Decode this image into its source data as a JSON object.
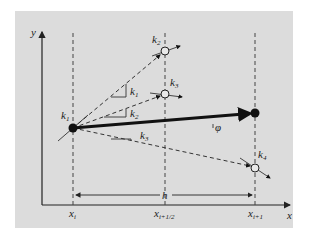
{
  "diagram": {
    "type": "runge-kutta-4-slope-estimates",
    "colors": {
      "panel": "#dcdcdc",
      "ink": "#1a1a1a",
      "dashed": "#444444"
    },
    "axes": {
      "x_label": "x",
      "y_label": "y"
    },
    "x_ticks": [
      {
        "id": "xi",
        "base": "x",
        "sub": "i"
      },
      {
        "id": "xhalf",
        "base": "x",
        "sub": "i+1/2"
      },
      {
        "id": "xnext",
        "base": "x",
        "sub": "i+1"
      }
    ],
    "slopes": {
      "k1": {
        "base": "k",
        "sub": "1"
      },
      "k2": {
        "base": "k",
        "sub": "2"
      },
      "k3": {
        "base": "k",
        "sub": "3"
      },
      "k4": {
        "base": "k",
        "sub": "4"
      }
    },
    "labels": {
      "phi": "φ",
      "step": "h"
    }
  }
}
